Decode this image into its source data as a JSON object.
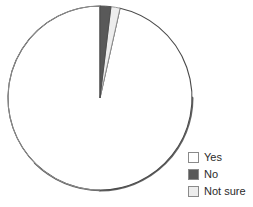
{
  "chart_data": {
    "type": "pie",
    "title": "",
    "categories": [
      "Yes",
      "No",
      "Not sure"
    ],
    "values": [
      96.5,
      1.9,
      1.6
    ],
    "unit": "percent",
    "start_angle_deg": 90,
    "direction": "counterclockwise",
    "legend_position": "bottom-right",
    "grid": false,
    "slices": [
      {
        "label": "Yes",
        "value": 96.5,
        "color": "#ffffff"
      },
      {
        "label": "No",
        "value": 1.9,
        "color": "#595959"
      },
      {
        "label": "Not sure",
        "value": 1.6,
        "color": "#ededed"
      }
    ]
  },
  "legend": {
    "items": [
      {
        "label": "Yes",
        "color": "#ffffff"
      },
      {
        "label": "No",
        "color": "#595959"
      },
      {
        "label": "Not sure",
        "color": "#ededed"
      }
    ]
  },
  "style": {
    "outline_color": "#4a4a4a",
    "outline_light": "#9a9a9a",
    "background": "#ffffff",
    "text_color": "#2b2b2b"
  }
}
